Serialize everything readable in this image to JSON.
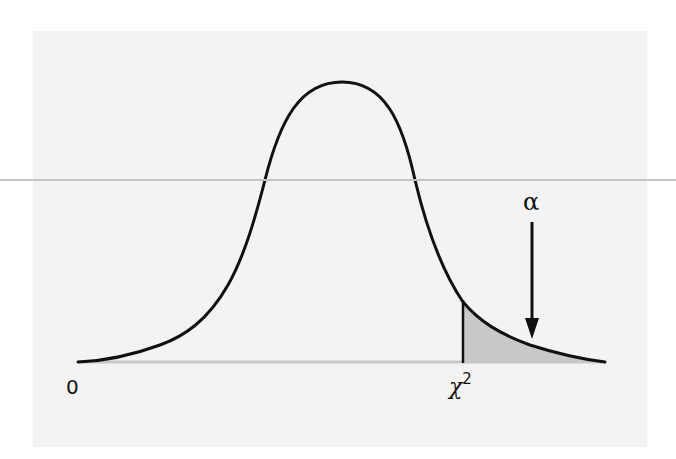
{
  "figure": {
    "labels": {
      "origin": "0",
      "critical_value_symbol": "χ",
      "critical_value_exponent": "2",
      "tail_area": "α"
    },
    "colors": {
      "panel_background": "#f3f3f3",
      "curve": "#111111",
      "baseline": "#c8c8c8",
      "tail_fill": "#c8c8c8",
      "divider_line": "#c4c4c4"
    },
    "icons": {
      "arrow": "arrow-down-icon"
    }
  }
}
